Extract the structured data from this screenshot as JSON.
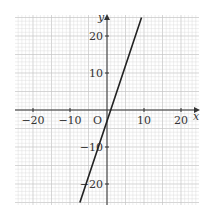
{
  "chart_data": {
    "type": "line",
    "title": "",
    "xlabel": "x",
    "ylabel": "y",
    "origin_label": "O",
    "xlim": [
      -25,
      25
    ],
    "ylim": [
      -25,
      25
    ],
    "grid": true,
    "minor_grid_step": 2,
    "major_grid_step": 10,
    "x_ticks": [
      -20,
      -10,
      10,
      20
    ],
    "x_tick_labels": [
      "−20",
      "−10",
      "10",
      "20"
    ],
    "y_ticks": [
      20,
      10,
      -10,
      -20
    ],
    "y_tick_labels": [
      "20",
      "10",
      "−10",
      "−20"
    ],
    "series": [
      {
        "name": "line",
        "equation": "y = 3x - 3",
        "x": [
          -7.33,
          9.33
        ],
        "y": [
          -25,
          25
        ],
        "color": "#222222"
      }
    ],
    "legend": null
  },
  "colors": {
    "grid_minor": "#d6d6d6",
    "grid_major": "#c4c4c4",
    "axis": "#333333",
    "line": "#222222"
  }
}
